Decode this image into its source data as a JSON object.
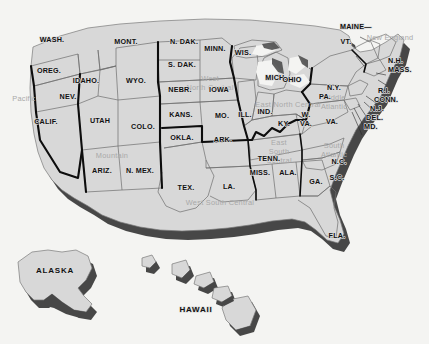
{
  "map": {
    "title": "United States Census Regions and Divisions Map",
    "colors": {
      "background": "#f4f4f2",
      "state_fill": "#d8d8d8",
      "state_fill_light": "#e2e2e2",
      "extrusion_shadow": "#4a4a4a",
      "extrusion_shadow_dark": "#3a3a3a",
      "state_border": "#6b6b6b",
      "region_border": "#0d0d0d",
      "state_label": "#111111",
      "region_label": "#a9a9a9"
    },
    "regions": [
      {
        "id": "pacific",
        "label": "Pacific"
      },
      {
        "id": "mountain",
        "label": "Mountain"
      },
      {
        "id": "west-north-central",
        "label_lines": [
          "West",
          "North Central"
        ]
      },
      {
        "id": "east-north-central",
        "label": "East North Central"
      },
      {
        "id": "west-south-central",
        "label": "West South Central"
      },
      {
        "id": "east-south-central",
        "label_lines": [
          "East",
          "South",
          "Central"
        ]
      },
      {
        "id": "south-atlantic",
        "label_lines": [
          "South",
          "Atlantic"
        ]
      },
      {
        "id": "middle-atlantic",
        "label_lines": [
          "Middle",
          "Atlantic"
        ]
      },
      {
        "id": "new-england",
        "label": "New England"
      }
    ],
    "region_labels": {
      "pacific": "Pacific",
      "mountain": "Mountain",
      "wnc_line1": "West",
      "wnc_line2": "North Central",
      "enc": "East North Central",
      "wsc": "West South Central",
      "esc_line1": "East",
      "esc_line2": "South",
      "esc_line3": "Central",
      "sa_line1": "South",
      "sa_line2": "Atlantic",
      "ma_line1": "Middle",
      "ma_line2": "Atlantic",
      "ne": "New England"
    },
    "states": {
      "wash": "WASH.",
      "oreg": "OREG.",
      "calif": "CALIF.",
      "nev": "NEV.",
      "idaho": "IDAHO.",
      "mont": "MONT.",
      "wyo": "WYO.",
      "utah": "UTAH",
      "colo": "COLO.",
      "ariz": "ARIZ.",
      "nmex": "N. MEX.",
      "ndak": "N. DAK.",
      "sdak": "S. DAK.",
      "nebr": "NEBR.",
      "kans": "KANS.",
      "minn": "MINN.",
      "iowa": "IOWA",
      "mo": "MO.",
      "okla": "OKLA.",
      "tex": "TEX.",
      "ark": "ARK.",
      "la": "LA.",
      "miss": "MISS.",
      "ala": "ALA.",
      "tenn": "TENN.",
      "ky": "KY.",
      "wis": "WIS.",
      "mich": "MICH.",
      "ill": "ILL.",
      "ind": "IND.",
      "ohio": "OHIO",
      "wva_l1": "W.",
      "wva_l2": "VA.",
      "va": "VA.",
      "nc": "N.C.",
      "sc": "S.C.",
      "ga": "GA.",
      "fla": "FLA.",
      "ny": "N.Y.",
      "pa": "PA.",
      "maine": "MAINE—",
      "vt": "VT.",
      "nh": "N.H.",
      "mass": "MASS.",
      "ri": "R.I.",
      "conn": "CONN.",
      "nj": "N.J.",
      "del": "DEL.",
      "md": "MD.",
      "alaska": "ALASKA",
      "hawaii": "HAWAII"
    }
  }
}
